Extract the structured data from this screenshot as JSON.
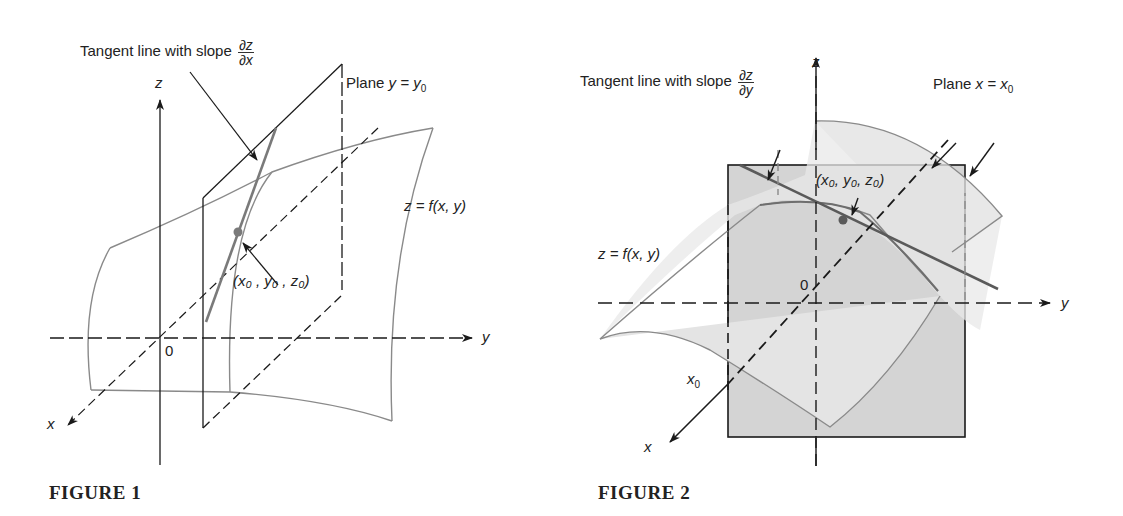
{
  "figure1": {
    "caption": "FIGURE 1",
    "tangent_label": "Tangent line with slope",
    "tangent_slope_num": "∂z",
    "tangent_slope_den": "∂x",
    "plane_label_prefix": "Plane",
    "plane_eq": "y = y",
    "plane_sub": "0",
    "surface_label": "z = f(x, y)",
    "point_label": "(x₀ , y₀ , z₀)",
    "axes": {
      "x": "x",
      "y": "y",
      "z": "z",
      "origin": "0"
    }
  },
  "figure2": {
    "caption": "FIGURE 2",
    "tangent_label": "Tangent line with slope",
    "tangent_slope_num": "∂z",
    "tangent_slope_den": "∂y",
    "plane_label_prefix": "Plane",
    "plane_eq": "x = x",
    "plane_sub": "0",
    "surface_label": "z = f(x, y)",
    "point_label": "(x₀, y₀, z₀)",
    "x0_label": "x",
    "x0_sub": "0",
    "axes": {
      "x": "x",
      "y": "y",
      "z": "z",
      "origin": "0"
    }
  },
  "colors": {
    "ink": "#1a1a1a",
    "surface_edge": "#8a8a8a",
    "plane_fill": "#d4d4d4",
    "surface_fill": "#e6e6e6",
    "tangent": "#7a7a7a"
  }
}
